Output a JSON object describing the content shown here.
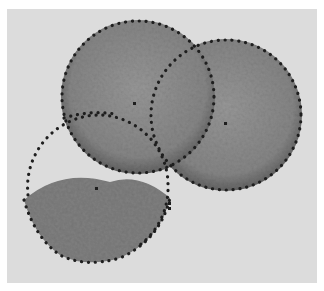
{
  "image": {
    "width": 324,
    "height": 291,
    "background": "#ffffff",
    "panel": {
      "x": 7,
      "y": 9,
      "w": 310,
      "h": 274,
      "fill": "#dcdcdc"
    },
    "colors": {
      "cell_fill": "#8a8a8a",
      "cell_fill_dark": "#6e6e6e",
      "outline_dots": "#1e1e1e"
    },
    "shapes": [
      {
        "name": "left-disc",
        "cx": 138,
        "cy": 97,
        "r": 77
      },
      {
        "name": "right-disc",
        "cx": 226,
        "cy": 115,
        "r": 76
      },
      {
        "name": "lower-crescent",
        "description": "half-disc fragment at lower left"
      },
      {
        "name": "dotted-circle-outline",
        "cx": 98,
        "cy": 187,
        "r": 72
      }
    ]
  }
}
